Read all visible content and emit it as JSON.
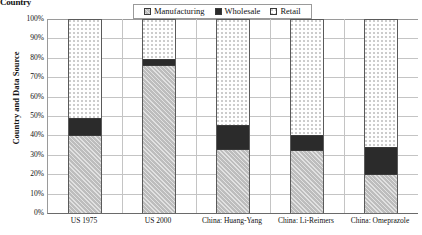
{
  "top_fragment": "Country",
  "chart_data": {
    "type": "bar",
    "subtype": "stacked-100-percent",
    "title": "",
    "xlabel": "",
    "ylabel": "Country and Data Source",
    "ylim": [
      0,
      100
    ],
    "ytick_labels": [
      "100%",
      "90%",
      "80%",
      "70%",
      "60%",
      "50%",
      "40%",
      "30%",
      "20%",
      "10%",
      "0%"
    ],
    "ytick_values": [
      100,
      90,
      80,
      70,
      60,
      50,
      40,
      30,
      20,
      10,
      0
    ],
    "grid": true,
    "legend_position": "top-center",
    "categories": [
      "US 1975",
      "US 2000",
      "China: Huang-Yang",
      "China: Li-Reimers",
      "China: Omeprazole"
    ],
    "series": [
      {
        "name": "Manufacturing",
        "color": "#bdbdbd",
        "pattern": "diagonal-hatch",
        "values": [
          40,
          76,
          32.5,
          32,
          19.5
        ]
      },
      {
        "name": "Wholesale",
        "color": "#2b2b2b",
        "pattern": "solid",
        "values": [
          9,
          4,
          13,
          8.5,
          14.5
        ]
      },
      {
        "name": "Retail",
        "color": "#ffffff",
        "pattern": "dotted",
        "values": [
          51,
          20,
          54.5,
          59.5,
          66
        ]
      }
    ]
  }
}
